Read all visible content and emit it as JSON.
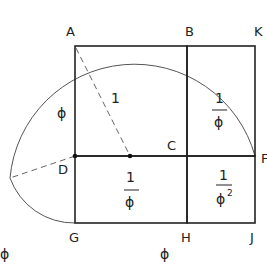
{
  "diagram": {
    "points": {
      "A": "A",
      "B": "B",
      "K": "K",
      "C": "C",
      "D": "D",
      "F": "F",
      "G": "G",
      "H": "H",
      "J": "J"
    },
    "labels": {
      "radius": "1",
      "side_ad": "ϕ",
      "upper_right_num": "1",
      "upper_right_den": "ϕ",
      "lower_mid_num": "1",
      "lower_mid_den": "ϕ",
      "lower_right_num": "1",
      "lower_right_den": "ϕ",
      "lower_right_exp": "2",
      "bottom_left": "ϕ",
      "bottom_mid": "ϕ"
    },
    "colors": {
      "line": "#222222",
      "arc": "#555555",
      "background": "#ffffff"
    }
  }
}
